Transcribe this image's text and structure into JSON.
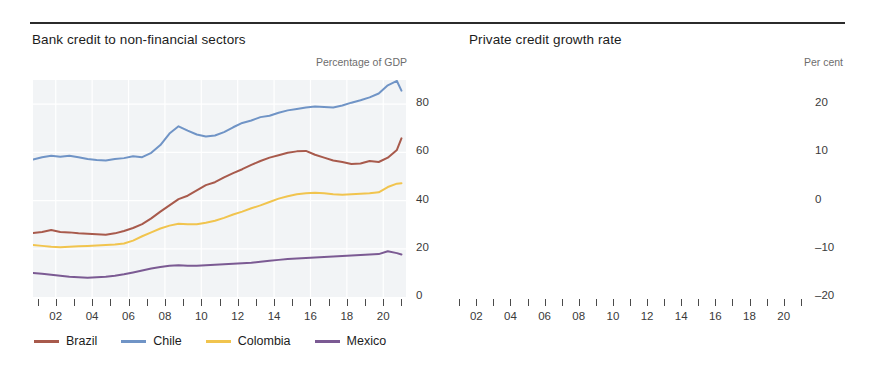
{
  "figure": {
    "panels": [
      {
        "id": "bank-credit",
        "title": "Bank credit to non-financial sectors",
        "unit": "Percentage of GDP"
      },
      {
        "id": "private-credit-growth",
        "title": "Private credit growth rate",
        "unit": "Per cent"
      }
    ],
    "legend_left": [
      {
        "label": "Brazil",
        "color": "#a85a4c"
      },
      {
        "label": "Chile",
        "color": "#7094c6"
      },
      {
        "label": "Colombia",
        "color": "#f1c44e"
      },
      {
        "label": "Mexico",
        "color": "#7b5a93"
      }
    ],
    "legend_right": {
      "group_label": "Latin America:",
      "group_superscript": "a",
      "items": [
        {
          "label": "Interquartile range",
          "color": "#9db49f",
          "kind": "band"
        },
        {
          "label": "mean",
          "color": "#537a63",
          "kind": "line"
        }
      ]
    }
  },
  "chart_data": [
    {
      "type": "line",
      "title": "Bank credit to non-financial sectors",
      "xlabel": "",
      "ylabel": "Percentage of GDP",
      "ylim": [
        0,
        90
      ],
      "yticks": [
        0,
        20,
        40,
        60,
        80
      ],
      "xlim": [
        2000.75,
        2021.25
      ],
      "xticks": [
        2001,
        2002,
        2003,
        2004,
        2005,
        2006,
        2007,
        2008,
        2009,
        2010,
        2011,
        2012,
        2013,
        2014,
        2015,
        2016,
        2017,
        2018,
        2019,
        2020,
        2021
      ],
      "xticklabels": [
        "",
        "02",
        "",
        "04",
        "",
        "06",
        "",
        "08",
        "",
        "10",
        "",
        "12",
        "",
        "14",
        "",
        "16",
        "",
        "18",
        "",
        "20",
        ""
      ],
      "grid": true,
      "x": [
        2000.75,
        2001.25,
        2001.75,
        2002.25,
        2002.75,
        2003.25,
        2003.75,
        2004.25,
        2004.75,
        2005.25,
        2005.75,
        2006.25,
        2006.75,
        2007.25,
        2007.75,
        2008.25,
        2008.75,
        2009.25,
        2009.75,
        2010.25,
        2010.75,
        2011.25,
        2011.75,
        2012.25,
        2012.75,
        2013.25,
        2013.75,
        2014.25,
        2014.75,
        2015.25,
        2015.75,
        2016.25,
        2016.75,
        2017.25,
        2017.75,
        2018.25,
        2018.75,
        2019.25,
        2019.75,
        2020.25,
        2020.75,
        2021.0
      ],
      "series": [
        {
          "name": "Brazil",
          "color": "#a85a4c",
          "values": [
            26.5,
            27.0,
            27.8,
            27.0,
            26.8,
            26.4,
            26.2,
            26.0,
            25.8,
            26.4,
            27.4,
            28.6,
            30.2,
            32.6,
            35.4,
            38.0,
            40.6,
            42.0,
            44.2,
            46.4,
            47.6,
            49.6,
            51.4,
            53.0,
            54.8,
            56.4,
            57.8,
            58.8,
            59.8,
            60.4,
            60.6,
            59.0,
            57.8,
            56.6,
            56.0,
            55.2,
            55.4,
            56.4,
            56.0,
            57.8,
            61.0,
            65.8
          ]
        },
        {
          "name": "Chile",
          "color": "#7094c6",
          "values": [
            57.0,
            58.0,
            58.6,
            58.2,
            58.6,
            58.0,
            57.2,
            56.8,
            56.6,
            57.2,
            57.6,
            58.4,
            58.0,
            59.8,
            63.0,
            67.8,
            70.8,
            69.0,
            67.4,
            66.6,
            67.0,
            68.4,
            70.4,
            72.2,
            73.2,
            74.6,
            75.2,
            76.4,
            77.4,
            78.0,
            78.6,
            79.0,
            78.8,
            78.6,
            79.4,
            80.6,
            81.6,
            82.8,
            84.4,
            87.8,
            89.6,
            85.6
          ]
        },
        {
          "name": "Colombia",
          "color": "#f1c44e",
          "values": [
            21.6,
            21.2,
            20.8,
            20.6,
            20.8,
            21.0,
            21.2,
            21.4,
            21.6,
            21.8,
            22.2,
            23.4,
            25.2,
            26.8,
            28.4,
            29.6,
            30.4,
            30.2,
            30.2,
            30.8,
            31.6,
            32.8,
            34.2,
            35.4,
            36.8,
            38.0,
            39.4,
            40.8,
            41.8,
            42.6,
            43.0,
            43.2,
            43.0,
            42.6,
            42.4,
            42.6,
            42.8,
            43.0,
            43.4,
            45.6,
            47.0,
            47.2
          ]
        },
        {
          "name": "Mexico",
          "color": "#7b5a93",
          "values": [
            10.0,
            9.6,
            9.2,
            8.8,
            8.4,
            8.2,
            8.0,
            8.2,
            8.4,
            8.8,
            9.4,
            10.2,
            11.0,
            11.8,
            12.4,
            13.0,
            13.2,
            13.0,
            13.0,
            13.2,
            13.4,
            13.6,
            13.8,
            14.0,
            14.2,
            14.6,
            15.0,
            15.4,
            15.8,
            16.0,
            16.2,
            16.4,
            16.6,
            16.8,
            17.0,
            17.2,
            17.4,
            17.6,
            17.8,
            19.0,
            18.2,
            17.6
          ]
        }
      ]
    },
    {
      "type": "line",
      "title": "Private credit growth rate",
      "xlabel": "",
      "ylabel": "Per cent",
      "ylim": [
        -20,
        25
      ],
      "yticks": [
        -20,
        -10,
        0,
        10,
        20
      ],
      "xlim": [
        2000.75,
        2021.25
      ],
      "xticks": [
        2001,
        2002,
        2003,
        2004,
        2005,
        2006,
        2007,
        2008,
        2009,
        2010,
        2011,
        2012,
        2013,
        2014,
        2015,
        2016,
        2017,
        2018,
        2019,
        2020,
        2021
      ],
      "xticklabels": [
        "",
        "02",
        "",
        "04",
        "",
        "06",
        "",
        "08",
        "",
        "10",
        "",
        "12",
        "",
        "14",
        "",
        "16",
        "",
        "18",
        "",
        "20",
        ""
      ],
      "grid": true,
      "zero_line": 0,
      "x": [
        2000.75,
        2001.0,
        2001.25,
        2001.5,
        2001.75,
        2002.0,
        2002.25,
        2002.5,
        2002.75,
        2003.0,
        2003.25,
        2003.5,
        2003.75,
        2004.0,
        2004.25,
        2004.5,
        2004.75,
        2005.0,
        2005.25,
        2005.5,
        2005.75,
        2006.0,
        2006.25,
        2006.5,
        2006.75,
        2007.0,
        2007.25,
        2007.5,
        2007.75,
        2008.0,
        2008.25,
        2008.5,
        2008.75,
        2009.0,
        2009.25,
        2009.5,
        2009.75,
        2010.0,
        2010.25,
        2010.5,
        2010.75,
        2011.0,
        2011.25,
        2011.5,
        2011.75,
        2012.0,
        2012.25,
        2012.5,
        2012.75,
        2013.0,
        2013.25,
        2013.5,
        2013.75,
        2014.0,
        2014.25,
        2014.5,
        2014.75,
        2015.0,
        2015.25,
        2015.5,
        2015.75,
        2016.0,
        2016.25,
        2016.5,
        2016.75,
        2017.0,
        2017.25,
        2017.5,
        2017.75,
        2018.0,
        2018.25,
        2018.5,
        2018.75,
        2019.0,
        2019.25,
        2019.5,
        2019.75,
        2020.0,
        2020.25,
        2020.5,
        2020.75,
        2021.0
      ],
      "series": [
        {
          "name": "mean",
          "color": "#537a63",
          "kind": "line",
          "values": [
            -8.5,
            -6.0,
            -3.0,
            -1.0,
            0.5,
            -1.5,
            -3.0,
            -1.0,
            1.0,
            -0.5,
            1.5,
            3.5,
            5.5,
            4.0,
            2.0,
            -2.0,
            -6.0,
            -9.0,
            -8.5,
            -6.5,
            -7.5,
            -6.0,
            -7.0,
            -5.5,
            -4.0,
            -5.0,
            -3.5,
            -1.5,
            1.0,
            3.5,
            5.5,
            4.0,
            5.0,
            6.5,
            5.0,
            3.5,
            2.0,
            1.0,
            0.0,
            2.0,
            5.0,
            8.0,
            11.0,
            13.0,
            11.0,
            8.0,
            5.0,
            2.5,
            1.0,
            2.0,
            4.0,
            3.0,
            4.5,
            3.0,
            5.0,
            5.5,
            6.0,
            5.5,
            6.5,
            6.0,
            6.5,
            6.5,
            7.0,
            6.5,
            4.5,
            3.0,
            1.0,
            -1.0,
            -1.5,
            -2.0,
            -1.5,
            -2.0,
            -1.5,
            -2.0,
            -1.0,
            0.0,
            1.5,
            4.0,
            7.5,
            9.0,
            7.5,
            6.5
          ]
        },
        {
          "name": "Interquartile range",
          "color": "#9db49f",
          "kind": "band",
          "lower": [
            -12.0,
            -10.0,
            -7.0,
            -5.0,
            -3.5,
            -5.0,
            -6.5,
            -5.0,
            -2.5,
            -4.0,
            -2.5,
            -0.5,
            1.5,
            0.0,
            -2.0,
            -6.0,
            -10.5,
            -13.5,
            -13.0,
            -11.0,
            -12.0,
            -10.5,
            -11.0,
            -10.0,
            -8.5,
            -9.5,
            -8.0,
            -6.0,
            -3.5,
            -1.0,
            1.0,
            -0.5,
            0.5,
            2.0,
            0.5,
            -1.0,
            -2.5,
            -3.5,
            -4.5,
            -2.5,
            0.5,
            3.0,
            6.0,
            8.0,
            6.0,
            3.5,
            0.5,
            -2.0,
            -3.5,
            -2.5,
            0.0,
            -1.0,
            0.5,
            -1.0,
            1.0,
            1.5,
            2.0,
            1.5,
            2.5,
            2.0,
            2.5,
            2.5,
            3.0,
            2.5,
            0.5,
            -1.0,
            -3.0,
            -5.0,
            -5.5,
            -6.0,
            -5.5,
            -6.0,
            -5.5,
            -6.0,
            -5.0,
            -4.0,
            -2.5,
            0.0,
            3.0,
            4.5,
            3.0,
            2.5
          ],
          "upper": [
            -5.0,
            -2.0,
            1.0,
            3.0,
            4.5,
            2.5,
            1.0,
            3.0,
            5.0,
            3.5,
            5.5,
            8.0,
            10.0,
            8.0,
            6.0,
            2.0,
            -2.0,
            -5.0,
            -4.5,
            -2.5,
            -3.5,
            -2.0,
            -3.0,
            -1.5,
            0.0,
            -1.0,
            0.5,
            2.5,
            5.0,
            7.5,
            10.0,
            8.5,
            9.5,
            11.0,
            9.5,
            8.0,
            6.5,
            5.0,
            4.0,
            6.0,
            9.0,
            12.5,
            16.5,
            22.0,
            17.0,
            13.0,
            9.5,
            7.0,
            5.0,
            6.0,
            8.0,
            7.0,
            8.5,
            7.0,
            9.0,
            9.5,
            10.0,
            9.5,
            10.5,
            10.0,
            10.5,
            10.5,
            11.0,
            10.5,
            8.5,
            7.0,
            5.0,
            3.0,
            2.5,
            2.0,
            2.5,
            2.0,
            2.5,
            2.0,
            3.0,
            4.0,
            5.5,
            8.0,
            12.0,
            13.5,
            12.0,
            10.5
          ]
        }
      ]
    }
  ]
}
